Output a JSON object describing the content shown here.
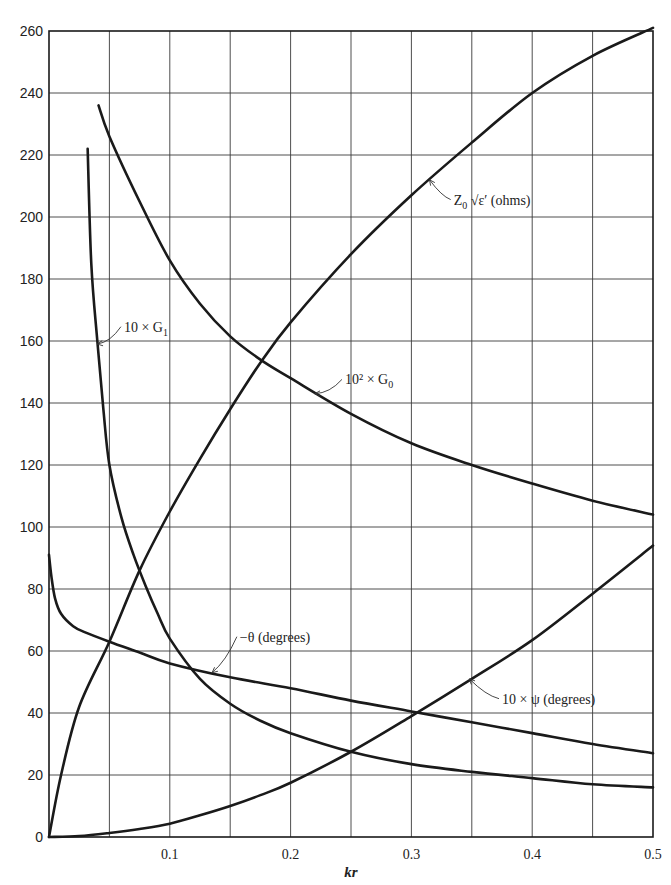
{
  "chart_data": {
    "type": "line",
    "title": "",
    "xlabel": "kr",
    "ylabel": "",
    "xlim": [
      0,
      0.5
    ],
    "ylim": [
      0,
      260
    ],
    "grid": true,
    "legend_position": "none (inline curve annotations)",
    "x_ticks": [
      0.1,
      0.2,
      0.3,
      0.4,
      0.5
    ],
    "x_tick_labels": [
      "0.1",
      "0.2",
      "0.3",
      "0.4",
      "0.5"
    ],
    "x_grid_step": 0.05,
    "y_ticks": [
      0,
      20,
      40,
      60,
      80,
      100,
      120,
      140,
      160,
      180,
      200,
      220,
      240,
      260
    ],
    "y_tick_labels": [
      "0",
      "20",
      "40",
      "60",
      "80",
      "100",
      "120",
      "140",
      "160",
      "180",
      "200",
      "220",
      "240",
      "260"
    ],
    "series": [
      {
        "name": "Z0 √ε′ (ohms)",
        "x": [
          0.0,
          0.01,
          0.025,
          0.05,
          0.075,
          0.1,
          0.125,
          0.15,
          0.175,
          0.2,
          0.25,
          0.3,
          0.35,
          0.4,
          0.45,
          0.5
        ],
        "y": [
          0,
          20,
          42,
          63,
          86,
          105,
          122,
          138,
          153,
          166,
          188,
          207,
          224,
          240,
          252,
          261
        ]
      },
      {
        "name": "10² × G0",
        "x": [
          0.041,
          0.05,
          0.075,
          0.1,
          0.125,
          0.15,
          0.175,
          0.2,
          0.25,
          0.3,
          0.35,
          0.4,
          0.45,
          0.5
        ],
        "y": [
          236,
          226,
          205,
          186,
          172,
          161.5,
          154,
          148,
          136.5,
          127,
          120,
          114,
          108.5,
          104
        ]
      },
      {
        "name": "10 × G1",
        "x": [
          0.032,
          0.035,
          0.04,
          0.045,
          0.05,
          0.06,
          0.07,
          0.08,
          0.09,
          0.1,
          0.125,
          0.15,
          0.175,
          0.2,
          0.25,
          0.3,
          0.35,
          0.4,
          0.45,
          0.5
        ],
        "y": [
          222,
          185,
          160,
          138,
          120,
          103,
          91,
          81,
          72,
          64,
          51,
          43,
          37.5,
          33.5,
          27.5,
          23.5,
          21,
          19,
          17,
          16
        ]
      },
      {
        "name": "−θ (degrees)",
        "x": [
          0.0,
          0.002,
          0.005,
          0.01,
          0.02,
          0.03,
          0.05,
          0.075,
          0.1,
          0.15,
          0.2,
          0.25,
          0.3,
          0.35,
          0.4,
          0.45,
          0.5
        ],
        "y": [
          91,
          84,
          77,
          72,
          68,
          66,
          63,
          59.5,
          56,
          51.5,
          48,
          44,
          40.5,
          37,
          33.5,
          30,
          27
        ]
      },
      {
        "name": "10 × ψ (degrees)",
        "x": [
          0.0,
          0.025,
          0.05,
          0.075,
          0.1,
          0.125,
          0.15,
          0.175,
          0.2,
          0.25,
          0.3,
          0.35,
          0.4,
          0.45,
          0.5
        ],
        "y": [
          0,
          0.3,
          1.3,
          2.6,
          4.3,
          7,
          10,
          13.5,
          17.5,
          27.5,
          39,
          51,
          63.5,
          78.5,
          94
        ]
      }
    ],
    "annotations": [
      {
        "text_main": "Z",
        "text_sub": "0",
        "text_rest": " √ε′ (ohms)",
        "series": "Z0 √ε′ (ohms)",
        "arrow_to": [
          0.315,
          212
        ],
        "text_at": [
          0.335,
          204
        ]
      },
      {
        "text_main": "10² × G",
        "text_sub": "0",
        "text_rest": "",
        "series": "10² × G0",
        "arrow_to": [
          0.22,
          143
        ],
        "text_at": [
          0.245,
          146
        ]
      },
      {
        "text_main": "10 × G",
        "text_sub": "1",
        "text_rest": "",
        "series": "10 × G1",
        "arrow_to": [
          0.04,
          159
        ],
        "text_at": [
          0.062,
          163
        ]
      },
      {
        "text_main": "−θ (degrees)",
        "text_sub": "",
        "text_rest": "",
        "series": "−θ (degrees)",
        "arrow_to": [
          0.135,
          53
        ],
        "text_at": [
          0.158,
          63
        ]
      },
      {
        "text_main": "10 × ψ (degrees)",
        "text_sub": "",
        "text_rest": "",
        "series": "10 × ψ (degrees)",
        "arrow_to": [
          0.348,
          51
        ],
        "text_at": [
          0.375,
          43
        ]
      }
    ]
  },
  "layout": {
    "plot_left_px": 49,
    "plot_right_px": 653,
    "plot_top_px": 31,
    "plot_bottom_px": 837
  }
}
